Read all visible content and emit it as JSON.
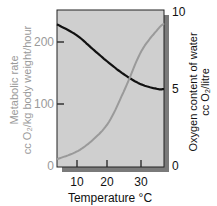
{
  "chart_data": {
    "type": "line",
    "title": "",
    "xlabel": "Temperature °C",
    "ylabel_left": "Metabolic rate",
    "ylabel_left_units": "cc O₂/kg body weight/hour",
    "ylabel_right": "Oxygen content of water",
    "ylabel_right_units": "cc O₂/litre",
    "x_ticks": [
      "10",
      "20",
      "30"
    ],
    "y_left_ticks": [
      "0",
      "100",
      "200"
    ],
    "y_right_ticks": [
      "0",
      "5",
      "10"
    ],
    "xlim": [
      4,
      37
    ],
    "ylim_left": [
      0,
      252
    ],
    "ylim_right": [
      0,
      10.2
    ],
    "grid": false,
    "legend": "none",
    "x": [
      4,
      10,
      15,
      20,
      25,
      30,
      35,
      37
    ],
    "series": [
      {
        "name": "Oxygen content of water",
        "axis": "right",
        "color": "#111111",
        "values": [
          9.2,
          8.5,
          7.6,
          6.7,
          5.9,
          5.3,
          5.0,
          5.0
        ]
      },
      {
        "name": "Metabolic rate",
        "axis": "left",
        "color": "#9a9a9a",
        "values": [
          11,
          23,
          42,
          71,
          125,
          185,
          220,
          230
        ]
      }
    ]
  },
  "colors": {
    "plot_bg": "#cfcfcf",
    "shadow": "#7a7a7a",
    "left_axis_text": "#9a9a9a",
    "right_axis_text": "#111111"
  }
}
